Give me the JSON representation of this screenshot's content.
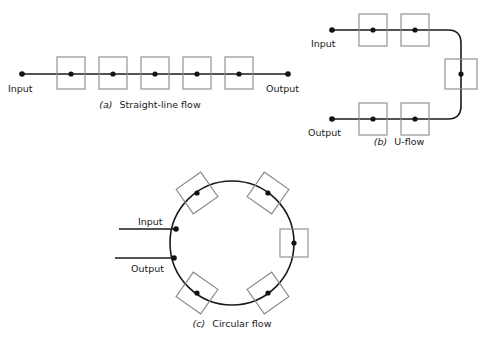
{
  "figure": {
    "background_color": "#ffffff",
    "line_color": "#1a1a1a",
    "box_stroke_color": "#8a8a8a",
    "dot_color": "#111111",
    "width": 488,
    "height": 340
  },
  "diagrams": [
    {
      "id": "straight-line-flow",
      "caption_tag": "(a)",
      "caption_text": "Straight-line flow",
      "input_label": "Input",
      "output_label": "Output",
      "station_count": 5,
      "line_orientation": "horizontal",
      "line": {
        "x1": 22,
        "y1": 74,
        "x2": 288,
        "y2": 74
      },
      "caption_position": {
        "x": 150,
        "y": 107
      },
      "input_label_position": {
        "x": 8,
        "y": 90
      },
      "output_label_position": {
        "x": 269,
        "y": 90
      },
      "input_dot": {
        "cx": 22,
        "cy": 74
      },
      "output_dot": {
        "cx": 288,
        "cy": 74
      },
      "boxes": [
        {
          "x": 57,
          "y": 57,
          "w": 28,
          "h": 32,
          "cx": 71,
          "cy": 74
        },
        {
          "x": 99,
          "y": 57,
          "w": 28,
          "h": 32,
          "cx": 113,
          "cy": 74
        },
        {
          "x": 141,
          "y": 57,
          "w": 28,
          "h": 32,
          "cx": 155,
          "cy": 74
        },
        {
          "x": 183,
          "y": 57,
          "w": 28,
          "h": 32,
          "cx": 197,
          "cy": 74
        },
        {
          "x": 225,
          "y": 57,
          "w": 28,
          "h": 32,
          "cx": 239,
          "cy": 74
        }
      ]
    },
    {
      "id": "u-flow",
      "caption_tag": "(b)",
      "caption_text": "U-flow",
      "input_label": "Input",
      "output_label": "Output",
      "station_count": 5,
      "line_orientation": "u-shape",
      "path": "M 332 30 L 448 30 Q 461 30 461 43 L 461 106 Q 461 119 448 119 L 332 119",
      "caption_position": {
        "x": 399,
        "y": 144
      },
      "input_label_position": {
        "x": 312,
        "y": 45
      },
      "output_label_position": {
        "x": 312,
        "y": 134
      },
      "input_dot": {
        "cx": 332,
        "cy": 30
      },
      "output_dot": {
        "cx": 332,
        "cy": 119
      },
      "boxes": [
        {
          "x": 359,
          "y": 14,
          "w": 28,
          "h": 32,
          "cx": 373,
          "cy": 30,
          "rot": 0
        },
        {
          "x": 401,
          "y": 14,
          "w": 28,
          "h": 32,
          "cx": 415,
          "cy": 30,
          "rot": 0
        },
        {
          "x": 445,
          "y": 59,
          "w": 32,
          "h": 30,
          "cx": 461,
          "cy": 74,
          "rot": 0
        },
        {
          "x": 359,
          "y": 103,
          "w": 28,
          "h": 32,
          "cx": 373,
          "cy": 119,
          "rot": 0
        },
        {
          "x": 401,
          "y": 103,
          "w": 28,
          "h": 32,
          "cx": 415,
          "cy": 119,
          "rot": 0
        }
      ]
    },
    {
      "id": "circular-flow",
      "caption_tag": "(c)",
      "caption_text": "Circular flow",
      "input_label": "Input",
      "output_label": "Output",
      "station_count": 5,
      "line_orientation": "circle",
      "circle": {
        "cx": 232,
        "cy": 243,
        "r": 62
      },
      "caption_position": {
        "x": 232,
        "y": 326
      },
      "input_label_position": {
        "x": 138,
        "y": 218
      },
      "output_label_position": {
        "x": 133,
        "y": 270
      },
      "input_line": {
        "x1": 119,
        "y1": 229,
        "x2": 176,
        "y2": 229
      },
      "output_line": {
        "x1": 115,
        "y1": 258,
        "x2": 174,
        "y2": 258
      },
      "input_dot": {
        "cx": 176,
        "cy": 229
      },
      "output_dot": {
        "cx": 174,
        "cy": 258
      },
      "boxes": [
        {
          "cx": 197,
          "cy": 193,
          "w": 30,
          "h": 30,
          "rot": -35
        },
        {
          "cx": 268,
          "cy": 193,
          "w": 30,
          "h": 30,
          "rot": 35
        },
        {
          "cx": 294,
          "cy": 243,
          "w": 28,
          "h": 28,
          "rot": 0
        },
        {
          "cx": 268,
          "cy": 293,
          "w": 30,
          "h": 30,
          "rot": -35
        },
        {
          "cx": 197,
          "cy": 293,
          "w": 30,
          "h": 30,
          "rot": 35
        }
      ]
    }
  ]
}
